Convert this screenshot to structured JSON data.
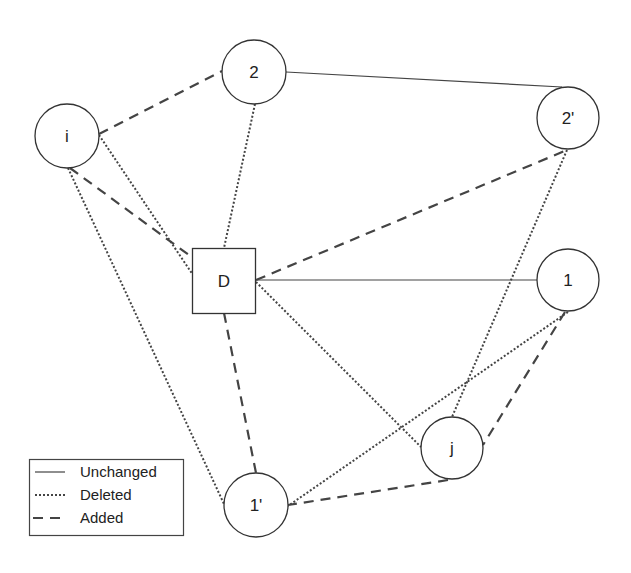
{
  "diagram": {
    "nodes": [
      {
        "id": "2",
        "label": "2",
        "shape": "circle",
        "x": 254,
        "y": 72,
        "r": 32
      },
      {
        "id": "i",
        "label": "i",
        "shape": "circle",
        "x": 67,
        "y": 136,
        "r": 32
      },
      {
        "id": "2p",
        "label": "2'",
        "shape": "circle",
        "x": 568,
        "y": 118,
        "r": 31
      },
      {
        "id": "D",
        "label": "D",
        "shape": "square",
        "x": 224,
        "y": 281,
        "w": 63,
        "h": 65
      },
      {
        "id": "1",
        "label": "1",
        "shape": "circle",
        "x": 568,
        "y": 280,
        "r": 31
      },
      {
        "id": "j",
        "label": "j",
        "shape": "circle",
        "x": 452,
        "y": 448,
        "r": 31
      },
      {
        "id": "1p",
        "label": "1'",
        "shape": "circle",
        "x": 256,
        "y": 505,
        "r": 32
      }
    ],
    "edges": [
      {
        "from": "2",
        "to": "2p",
        "type": "unchanged",
        "pts": [
          286,
          72,
          562,
          87
        ]
      },
      {
        "from": "D",
        "to": "1",
        "type": "unchanged",
        "pts": [
          256,
          280,
          537,
          280
        ]
      },
      {
        "from": "i",
        "to": "D",
        "type": "deleted",
        "pts": [
          99,
          135,
          193,
          275
        ]
      },
      {
        "from": "i",
        "to": "1p",
        "type": "deleted",
        "pts": [
          68,
          168,
          224,
          504
        ]
      },
      {
        "from": "2",
        "to": "D",
        "type": "deleted",
        "pts": [
          255,
          104,
          224,
          248
        ]
      },
      {
        "from": "2p",
        "to": "j",
        "type": "deleted",
        "pts": [
          567,
          150,
          452,
          417
        ]
      },
      {
        "from": "D",
        "to": "j",
        "type": "deleted",
        "pts": [
          256,
          282,
          421,
          447
        ]
      },
      {
        "from": "1",
        "to": "1p",
        "type": "deleted",
        "pts": [
          568,
          312,
          288,
          506
        ]
      },
      {
        "from": "i",
        "to": "2",
        "type": "added",
        "pts": [
          99,
          134,
          222,
          71
        ]
      },
      {
        "from": "i",
        "to": "D",
        "type": "added",
        "pts": [
          70,
          168,
          193,
          258
        ]
      },
      {
        "from": "D",
        "to": "2p",
        "type": "added",
        "pts": [
          256,
          280,
          567,
          150
        ]
      },
      {
        "from": "D",
        "to": "1p",
        "type": "added",
        "pts": [
          224,
          313,
          256,
          473
        ]
      },
      {
        "from": "1",
        "to": "j",
        "type": "added",
        "pts": [
          565,
          312,
          483,
          445
        ]
      },
      {
        "from": "j",
        "to": "1p",
        "type": "added",
        "pts": [
          448,
          480,
          288,
          505
        ]
      }
    ],
    "styles": {
      "unchanged": {
        "dash": "",
        "width": 1.2
      },
      "deleted": {
        "dash": "2 2",
        "width": 2
      },
      "added": {
        "dash": "10 7",
        "width": 2.2
      }
    },
    "colors": {
      "stroke": "#444444",
      "node_stroke": "#333333",
      "background": "#ffffff"
    }
  },
  "legend": {
    "items": [
      {
        "label": "Unchanged",
        "type": "unchanged"
      },
      {
        "label": "Deleted",
        "type": "deleted"
      },
      {
        "label": "Added",
        "type": "added"
      }
    ]
  }
}
